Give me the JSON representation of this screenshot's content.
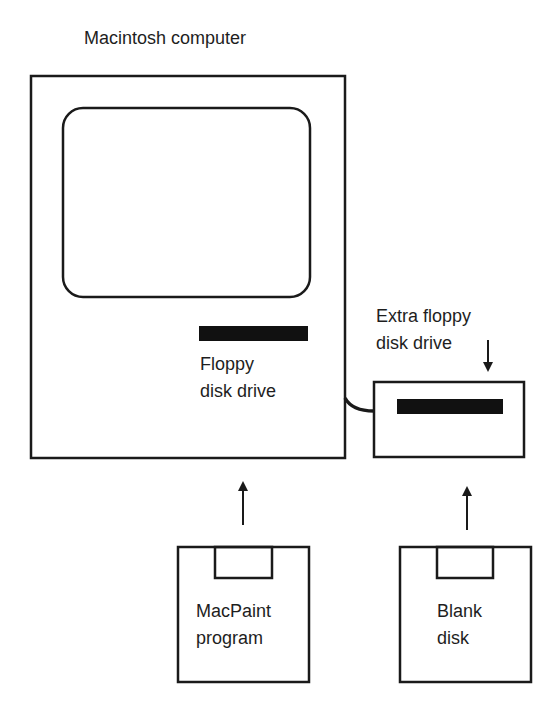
{
  "diagram": {
    "title": "Macintosh computer",
    "computer": {
      "label": "Macintosh computer",
      "drive_label_line1": "Floppy",
      "drive_label_line2": "disk drive"
    },
    "extra_drive": {
      "label_line1": "Extra floppy",
      "label_line2": "disk drive"
    },
    "disks": [
      {
        "label_line1": "MacPaint",
        "label_line2": "program"
      },
      {
        "label_line1": "Blank",
        "label_line2": "disk"
      }
    ],
    "colors": {
      "stroke": "#1a1a1a",
      "background": "#ffffff"
    }
  }
}
